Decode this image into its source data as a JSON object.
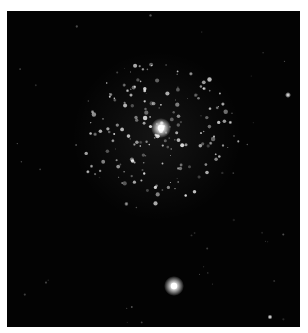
{
  "image": {
    "subject": "globular star cluster with bright foreground stars",
    "background_color": "#030303",
    "border_color": "#ffffff",
    "star_color": "#ffffff"
  }
}
